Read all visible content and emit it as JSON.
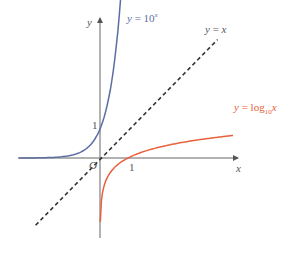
{
  "chart_data": {
    "type": "line",
    "title": "",
    "xlabel": "x",
    "ylabel": "y",
    "origin_label": "O",
    "x_ticks": [
      {
        "value": 1,
        "label": "1"
      }
    ],
    "y_ticks": [
      {
        "value": 1,
        "label": "1"
      }
    ],
    "grid": false,
    "legend": "inline labels",
    "series": [
      {
        "name": "y = 10^x",
        "label_lhs": "y",
        "label_eq": "=",
        "label_base": "10",
        "label_sup": "x",
        "color": "#5b6ea3",
        "style": "solid",
        "x": [
          -2.6,
          -2,
          -1,
          -0.5,
          0,
          0.5,
          1,
          1.25
        ],
        "y": [
          0.003,
          0.01,
          0.1,
          0.32,
          1,
          3.16,
          10,
          17.8
        ]
      },
      {
        "name": "y = x",
        "label_lhs": "y",
        "label_eq": "=",
        "label_rhs": "x",
        "color": "#333333",
        "style": "dashed",
        "x": [
          -2,
          3.8
        ],
        "y": [
          -2,
          3.8
        ]
      },
      {
        "name": "y = log10 x",
        "label_lhs": "y",
        "label_eq": "=",
        "label_fn": "log",
        "label_sub": "10",
        "label_arg": "x",
        "color": "#e8603c",
        "style": "solid",
        "x": [
          0.01,
          0.1,
          0.5,
          1,
          2,
          4
        ],
        "y": [
          -2,
          -1,
          -0.3,
          0,
          0.3,
          0.6
        ]
      }
    ],
    "xlim": [
      -2.6,
      4.4
    ],
    "ylim": [
      -2.6,
      4.4
    ]
  },
  "colors": {
    "exp": "#5b6ea3",
    "log": "#e8603c",
    "identity": "#333333",
    "axis": "#555555"
  }
}
